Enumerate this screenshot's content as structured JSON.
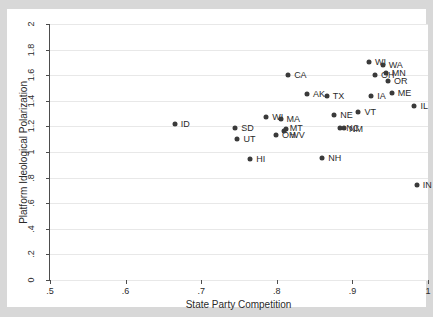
{
  "chart_data": {
    "type": "scatter",
    "title": "",
    "xlabel": "State Party Competition",
    "ylabel": "Platform Ideological Polarization",
    "xlim": [
      0.5,
      1.0
    ],
    "ylim": [
      0,
      2.0
    ],
    "xticks": [
      ".5",
      ".6",
      ".7",
      ".8",
      ".9",
      "1"
    ],
    "xtick_values": [
      0.5,
      0.6,
      0.7,
      0.8,
      0.9,
      1.0
    ],
    "yticks": [
      "0",
      ".2",
      ".4",
      ".6",
      ".8",
      "1",
      "1.2",
      "1.4",
      "1.6",
      "1.8",
      "2"
    ],
    "ytick_values": [
      0,
      0.2,
      0.4,
      0.6,
      0.8,
      1.0,
      1.2,
      1.4,
      1.6,
      1.8,
      2.0
    ],
    "grid": "horizontal",
    "legend": "none",
    "marker_color": "#3a3a3a",
    "gridline_color": "#e8e8e8",
    "axis_color": "#4d4d4d",
    "background_color": "#d8d8d8",
    "plot_background_color": "#ffffff",
    "points": [
      {
        "label": "ID",
        "x": 0.665,
        "y": 1.22,
        "lx": 6,
        "ly": 0
      },
      {
        "label": "SD",
        "x": 0.745,
        "y": 1.185,
        "lx": 6,
        "ly": 0
      },
      {
        "label": "UT",
        "x": 0.748,
        "y": 1.1,
        "lx": 6,
        "ly": 0
      },
      {
        "label": "HI",
        "x": 0.765,
        "y": 0.945,
        "lx": 6,
        "ly": 0
      },
      {
        "label": "WI",
        "x": 0.786,
        "y": 1.27,
        "lx": 6,
        "ly": 0
      },
      {
        "label": "MA",
        "x": 0.805,
        "y": 1.255,
        "lx": 6,
        "ly": 0
      },
      {
        "label": "OH",
        "x": 0.799,
        "y": 1.135,
        "lx": 6,
        "ly": 0
      },
      {
        "label": "MT",
        "x": 0.812,
        "y": 1.18,
        "lx": 4,
        "ly": -1
      },
      {
        "label": "WV",
        "x": 0.81,
        "y": 1.165,
        "lx": 6,
        "ly": 4
      },
      {
        "label": "CA",
        "x": 0.815,
        "y": 1.6,
        "lx": 6,
        "ly": 0
      },
      {
        "label": "AK",
        "x": 0.84,
        "y": 1.45,
        "lx": 6,
        "ly": 0
      },
      {
        "label": "NH",
        "x": 0.86,
        "y": 0.955,
        "lx": 6,
        "ly": 0
      },
      {
        "label": "TX",
        "x": 0.866,
        "y": 1.44,
        "lx": 6,
        "ly": 0
      },
      {
        "label": "NE",
        "x": 0.876,
        "y": 1.29,
        "lx": 6,
        "ly": 0
      },
      {
        "label": "NC",
        "x": 0.884,
        "y": 1.19,
        "lx": 6,
        "ly": 0
      },
      {
        "label": "NM",
        "x": 0.889,
        "y": 1.185,
        "lx": 5,
        "ly": 1
      },
      {
        "label": "VT",
        "x": 0.908,
        "y": 1.31,
        "lx": 6,
        "ly": 0
      },
      {
        "label": "WI",
        "x": 0.922,
        "y": 1.7,
        "lx": 6,
        "ly": 0
      },
      {
        "label": "IA",
        "x": 0.925,
        "y": 1.435,
        "lx": 6,
        "ly": 0
      },
      {
        "label": "OH",
        "x": 0.93,
        "y": 1.6,
        "lx": 6,
        "ly": 0
      },
      {
        "label": "WA",
        "x": 0.94,
        "y": 1.68,
        "lx": 6,
        "ly": 0
      },
      {
        "label": "MN",
        "x": 0.944,
        "y": 1.615,
        "lx": 6,
        "ly": 0
      },
      {
        "label": "OR",
        "x": 0.947,
        "y": 1.555,
        "lx": 6,
        "ly": 0
      },
      {
        "label": "ME",
        "x": 0.952,
        "y": 1.46,
        "lx": 6,
        "ly": 0
      },
      {
        "label": "IL",
        "x": 0.982,
        "y": 1.36,
        "lx": 6,
        "ly": 0
      },
      {
        "label": "IN",
        "x": 0.985,
        "y": 0.74,
        "lx": 6,
        "ly": 0
      }
    ]
  }
}
